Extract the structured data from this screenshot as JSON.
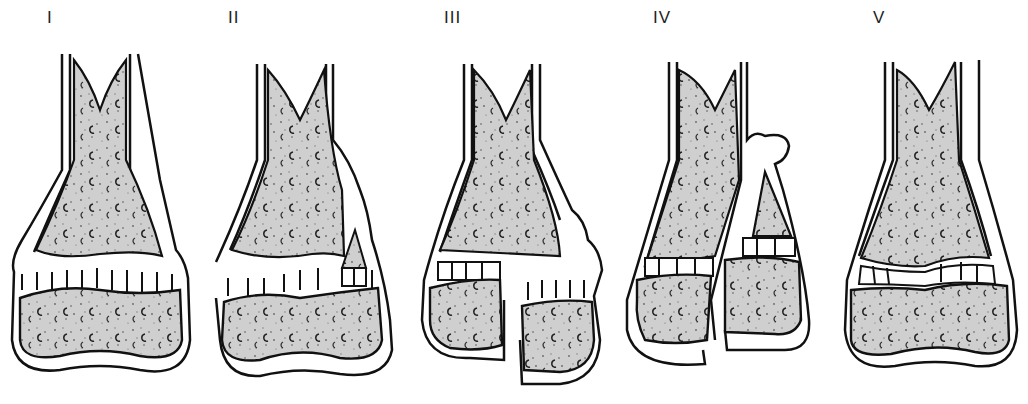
{
  "diagram": {
    "type": "growth-plate fracture classification",
    "panels": [
      {
        "label": "I",
        "x": 47,
        "description": "Separation through the physis; epiphysis displaced from metaphysis"
      },
      {
        "label": "II",
        "x": 228,
        "description": "Fracture through physis exiting through a metaphyseal fragment"
      },
      {
        "label": "III",
        "x": 444,
        "description": "Fracture through physis exiting through the epiphysis into the joint"
      },
      {
        "label": "IV",
        "x": 653,
        "description": "Fracture crossing metaphysis, physis and epiphysis"
      },
      {
        "label": "V",
        "x": 873,
        "description": "Compression / crush injury of the physis"
      }
    ]
  },
  "colors": {
    "line": "#111111",
    "bone_fill": "#c9c9c9",
    "speckle": "#555555",
    "background": "#ffffff"
  }
}
